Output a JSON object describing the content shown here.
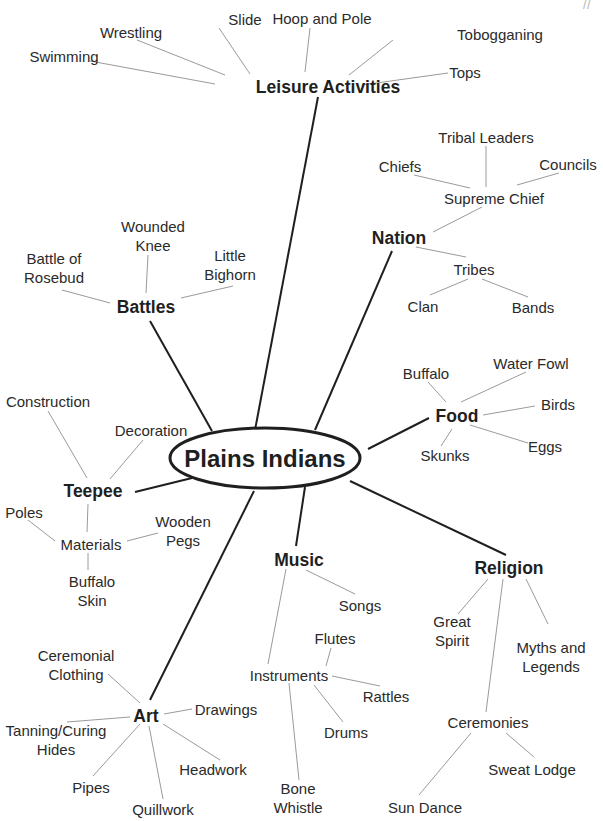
{
  "center": {
    "label": "Plains Indians",
    "x": 265,
    "y": 458
  },
  "corner_mark": "//",
  "categories": {
    "leisure": {
      "label": "Leisure Activities",
      "x": 328,
      "y": 87
    },
    "nation": {
      "label": "Nation",
      "x": 399,
      "y": 238
    },
    "battles": {
      "label": "Battles",
      "x": 146,
      "y": 307
    },
    "food": {
      "label": "Food",
      "x": 457,
      "y": 416
    },
    "teepee": {
      "label": "Teepee",
      "x": 93,
      "y": 491
    },
    "music": {
      "label": "Music",
      "x": 299,
      "y": 560
    },
    "religion": {
      "label": "Religion",
      "x": 509,
      "y": 568
    },
    "art": {
      "label": "Art",
      "x": 146,
      "y": 716
    }
  },
  "nodes": {
    "swimming": {
      "label": "Swimming",
      "x": 64,
      "y": 56
    },
    "wrestling": {
      "label": "Wrestling",
      "x": 131,
      "y": 32
    },
    "slide": {
      "label": "Slide",
      "x": 245,
      "y": 19
    },
    "hoop_and_pole": {
      "label": "Hoop and Pole",
      "x": 322,
      "y": 18
    },
    "tobogganing": {
      "label": "Tobogganing",
      "x": 500,
      "y": 34
    },
    "tops": {
      "label": "Tops",
      "x": 465,
      "y": 72
    },
    "tribal_leaders": {
      "label": "Tribal Leaders",
      "x": 486,
      "y": 137
    },
    "chiefs": {
      "label": "Chiefs",
      "x": 400,
      "y": 166
    },
    "councils": {
      "label": "Councils",
      "x": 568,
      "y": 164
    },
    "supreme_chief": {
      "label": "Supreme Chief",
      "x": 494,
      "y": 198
    },
    "tribes": {
      "label": "Tribes",
      "x": 474,
      "y": 269
    },
    "clan": {
      "label": "Clan",
      "x": 423,
      "y": 306
    },
    "bands": {
      "label": "Bands",
      "x": 533,
      "y": 307
    },
    "wounded_knee": {
      "label": "Wounded Knee",
      "x": 153,
      "y": 236
    },
    "battle_of_rosebud": {
      "label": "Battle of Rosebud",
      "x": 54,
      "y": 268
    },
    "little_bighorn": {
      "label": "Little Bighorn",
      "x": 230,
      "y": 265
    },
    "buffalo_food": {
      "label": "Buffalo",
      "x": 426,
      "y": 373
    },
    "water_fowl": {
      "label": "Water Fowl",
      "x": 531,
      "y": 363
    },
    "birds": {
      "label": "Birds",
      "x": 558,
      "y": 404
    },
    "eggs": {
      "label": "Eggs",
      "x": 545,
      "y": 446
    },
    "skunks": {
      "label": "Skunks",
      "x": 445,
      "y": 455
    },
    "construction": {
      "label": "Construction",
      "x": 48,
      "y": 401
    },
    "decoration": {
      "label": "Decoration",
      "x": 151,
      "y": 430
    },
    "poles": {
      "label": "Poles",
      "x": 24,
      "y": 512
    },
    "materials": {
      "label": "Materials",
      "x": 91,
      "y": 544
    },
    "wooden_pegs": {
      "label": "Wooden Pegs",
      "x": 183,
      "y": 531
    },
    "buffalo_skin": {
      "label": "Buffalo Skin",
      "x": 92,
      "y": 591
    },
    "songs": {
      "label": "Songs",
      "x": 360,
      "y": 605
    },
    "flutes": {
      "label": "Flutes",
      "x": 335,
      "y": 638
    },
    "instruments": {
      "label": "Instruments",
      "x": 289,
      "y": 675
    },
    "rattles": {
      "label": "Rattles",
      "x": 386,
      "y": 696
    },
    "drums": {
      "label": "Drums",
      "x": 346,
      "y": 732
    },
    "bone_whistle": {
      "label": "Bone Whistle",
      "x": 298,
      "y": 798
    },
    "great_spirit": {
      "label": "Great Spirit",
      "x": 452,
      "y": 631
    },
    "myths_and_legends": {
      "label": "Myths and Legends",
      "x": 551,
      "y": 657
    },
    "ceremonies": {
      "label": "Ceremonies",
      "x": 488,
      "y": 722
    },
    "sweat_lodge": {
      "label": "Sweat Lodge",
      "x": 532,
      "y": 769
    },
    "sun_dance": {
      "label": "Sun Dance",
      "x": 425,
      "y": 807
    },
    "ceremonial_clothing": {
      "label": "Ceremonial Clothing",
      "x": 76,
      "y": 665
    },
    "drawings": {
      "label": "Drawings",
      "x": 226,
      "y": 709
    },
    "tanning_curing_hides": {
      "label": "Tanning/Curing Hides",
      "x": 56,
      "y": 740
    },
    "headwork": {
      "label": "Headwork",
      "x": 213,
      "y": 769
    },
    "pipes": {
      "label": "Pipes",
      "x": 91,
      "y": 787
    },
    "quillwork": {
      "label": "Quillwork",
      "x": 163,
      "y": 809
    }
  }
}
